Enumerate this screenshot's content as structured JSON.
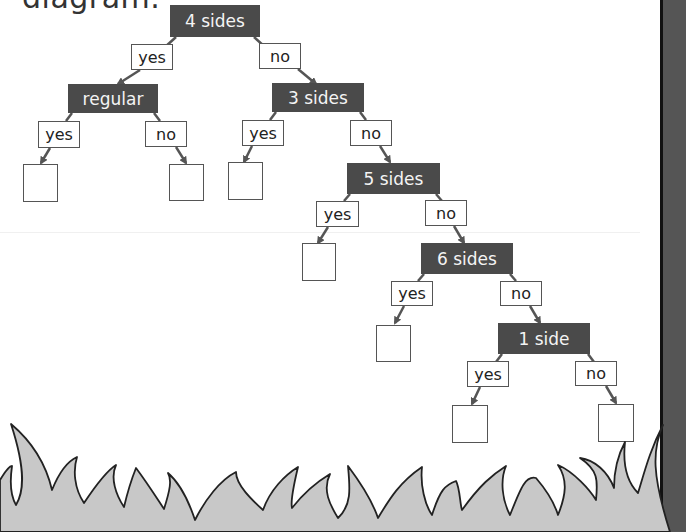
{
  "heading": {
    "text": "diagram."
  },
  "colors": {
    "node_fill": "#4a4a4a",
    "node_text": "#f4f4f4",
    "grass": "#c8c8c8",
    "strip": "#555555",
    "arrow": "#555555"
  },
  "nodes": [
    {
      "id": "n1",
      "label": "4 sides"
    },
    {
      "id": "n2",
      "label": "regular"
    },
    {
      "id": "n3",
      "label": "3 sides"
    },
    {
      "id": "n4",
      "label": "5 sides"
    },
    {
      "id": "n5",
      "label": "6 sides"
    },
    {
      "id": "n6",
      "label": "1 side"
    }
  ],
  "branches": {
    "yes": "yes",
    "no": "no"
  },
  "answer_boxes": {
    "count": 8,
    "value": ""
  }
}
